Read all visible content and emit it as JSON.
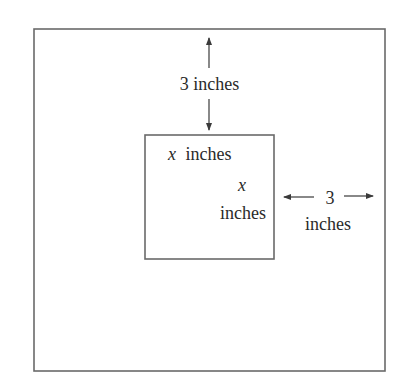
{
  "diagram": {
    "type": "box-in-box dimension figure",
    "colors": {
      "background": "#ffffff",
      "line": "#6a6a6a",
      "arrow": "#3a3a3a",
      "text": "#2a2a2a"
    },
    "outer_box": {
      "x": 34,
      "y": 29,
      "width": 351,
      "height": 342
    },
    "inner_box": {
      "x": 145,
      "y": 135,
      "width": 129,
      "height": 124
    },
    "labels": {
      "top_gap": {
        "value": "3",
        "unit": "inches",
        "text": "3 inches"
      },
      "inner_width": {
        "var": "x",
        "unit": "inches"
      },
      "inner_height": {
        "var": "x",
        "unit": "inches"
      },
      "right_gap": {
        "value": "3",
        "unit": "inches"
      }
    }
  }
}
